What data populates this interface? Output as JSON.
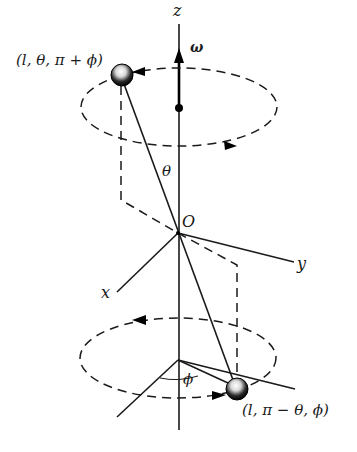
{
  "diagram": {
    "type": "physics-rotation-diagram",
    "colors": {
      "ink": "#1a1a1a",
      "background": "#ffffff"
    },
    "axes": {
      "z": "z",
      "x": "x",
      "y": "y",
      "origin": "O"
    },
    "angular_velocity_label": "ω",
    "angle_labels": {
      "theta": "θ",
      "phi": "ϕ"
    },
    "masses": [
      {
        "name": "upper-mass",
        "label": "(l, θ, π + ϕ)"
      },
      {
        "name": "lower-mass",
        "label": "(l, π − θ, ϕ)"
      }
    ],
    "orbits": [
      {
        "name": "upper-orbit",
        "style": "dashed",
        "direction": "counterclockwise-from-above"
      },
      {
        "name": "lower-orbit",
        "style": "dashed",
        "direction": "counterclockwise-from-above"
      }
    ]
  }
}
